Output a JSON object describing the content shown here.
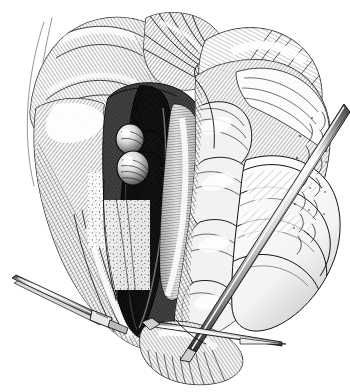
{
  "figure": {
    "kind": "medical-illustration",
    "medium": "pen-and-ink line engraving",
    "title": "Retroperitoneal exposure of the great vessels",
    "background_color": "#ffffff",
    "ink_color": "#111111",
    "mid_tone_color": "#6d6d6d",
    "light_tone_color": "#bcbcbc",
    "highlight_color": "#ffffff",
    "width": 350,
    "height": 392
  },
  "regions": [
    {
      "id": "upper-left-flap",
      "label": "Retracted peritoneal flap, upper left",
      "tone": "light with dense parallel hatching",
      "note": "Large pale tissue flap turned back toward the left shoulder of the field"
    },
    {
      "id": "upper-center-fold",
      "label": "Folded mesenteric leaf, upper center",
      "tone": "mid grey, convergent cross-hatch",
      "note": "Tissue gathers into a puckered fold at the apex of the incision"
    },
    {
      "id": "upper-right-flap",
      "label": "Retracted flap, upper right",
      "tone": "light, fine radiating strokes",
      "note": "Upper right tissue sheet lifted away from the field"
    },
    {
      "id": "central-cavity",
      "label": "Exposed retroperitoneal cavity",
      "tone": "darkest, near solid black hatching",
      "note": "Deep shadowed trough running vertically down the middle of the field"
    },
    {
      "id": "great-vessel",
      "label": "Great vessel (aorta / vena cava)",
      "tone": "very dark, dense cross-hatch with rim highlight",
      "note": "Broad dark tubular structure descending through the centre"
    },
    {
      "id": "paired-nodules",
      "label": "Paired rounded nodular structures",
      "tone": "light with crisp highlight and curved hatch",
      "note": "Two glossy spherical bodies left of the great vessel"
    },
    {
      "id": "adjacent-tube",
      "label": "Adjacent tubular structure",
      "tone": "mid grey with longitudinal hatching",
      "note": "Pale tube lying to the right of the dark vessel"
    },
    {
      "id": "muscle-fascia",
      "label": "Muscle and fascia, lower left",
      "tone": "mid grey, longitudinal striations",
      "note": "Striated muscle belly and overlying fascia in the lower left of the cavity"
    },
    {
      "id": "bowel-loops",
      "label": "Bowel loops, right field",
      "tone": "pale outline with light contour shading",
      "note": "Rounded loops of bowel packed along the right margin"
    },
    {
      "id": "omental-fat",
      "label": "Fatty tissue, right margin",
      "tone": "sparse stipple and broken line",
      "note": "Loose stippled fat marks along the extreme right edge"
    },
    {
      "id": "lower-tissue",
      "label": "Inferior tissue edge",
      "tone": "mid grey with fine hair-like strokes",
      "note": "Shaggy fringed tissue border at the bottom of the field"
    }
  ],
  "instruments": [
    {
      "id": "instrument-right",
      "label": "Long retractor / probe, upper right",
      "entry": "upper right, running down and to the left",
      "appearance": "slender twin-lined metal shaft with bright highlight"
    },
    {
      "id": "instrument-left",
      "label": "Forceps, lower left",
      "entry": "lower left, angled up and to the right",
      "appearance": "narrow tapering jaws with a hinge box near the tissue"
    },
    {
      "id": "instrument-bottom",
      "label": "Pointed dissector, lower right",
      "entry": "bottom right, horizontal needle-fine tip",
      "appearance": "sharp tapering point extending to the right margin"
    }
  ],
  "annotations": {
    "labels_visible": false,
    "leader_lines_visible": false,
    "caption_visible": false,
    "signature_visible": false,
    "text_on_image": ""
  }
}
